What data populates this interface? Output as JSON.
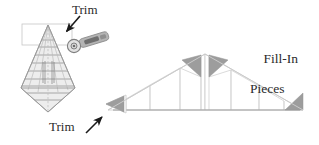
{
  "figure": {
    "title_labels": {
      "trim_top": "Trim",
      "trim_bottom": "Trim",
      "fill_in_line1": "Fill-In",
      "fill_in_line2": "Pieces"
    },
    "colors": {
      "text": "#2b2b2b",
      "outline": "#b9b9b9",
      "fill_piece_gray": "#9d9d9d",
      "ruler_line": "#8f8f8f",
      "ruler_face": "#e9e9e9",
      "cutter_body": "#b0b0b0",
      "cutter_dark": "#6d6d6d",
      "arrow": "#1a1a1a",
      "guide_box": "#c8c8c8",
      "baseline": "#9a9a9a"
    }
  },
  "left_panel": {
    "name": "triangle-ruler-being-trimmed",
    "ruler": {
      "shape": "cone-kite-template",
      "apex": [
        48,
        25
      ],
      "left_base": [
        21,
        88
      ],
      "right_base": [
        75,
        88
      ],
      "bottom_point": [
        48,
        112
      ],
      "horizontal_rule_count": 8,
      "radial_line_count": 4,
      "markings_text": ""
    },
    "cutter": {
      "name": "rotary-cutter",
      "blade_center": [
        74,
        46
      ],
      "blade_radius": 6,
      "handle_angle_deg": -18
    },
    "guide_box": {
      "x": 22,
      "y": 24,
      "width": 50,
      "height": 21
    },
    "arrow_top": {
      "from": [
        78,
        17
      ],
      "to": [
        67,
        31
      ]
    },
    "arrow_bottom": {
      "from": [
        88,
        132
      ],
      "to": [
        102,
        118
      ]
    }
  },
  "right_panel": {
    "name": "fill-in-pieces-triangle-assembly",
    "outer_triangle": {
      "apex": [
        205,
        54
      ],
      "left_base": [
        108,
        110
      ],
      "right_base": [
        303,
        110
      ]
    },
    "center_split_x": 205,
    "fill_in_pieces": [
      {
        "name": "apex-left-piece",
        "orientation": "points-left",
        "points": "201,55 201,76 183,60"
      },
      {
        "name": "apex-right-piece",
        "orientation": "points-right",
        "points": "209,55 209,76 227,60"
      },
      {
        "name": "left-end-piece",
        "orientation": "points-left",
        "points": "124,96 124,113 106,104"
      },
      {
        "name": "right-end-piece",
        "orientation": "points-right",
        "points": "286,110 304,110 304,94"
      }
    ],
    "internal_divider_count": 8,
    "baseline_y": 110
  }
}
